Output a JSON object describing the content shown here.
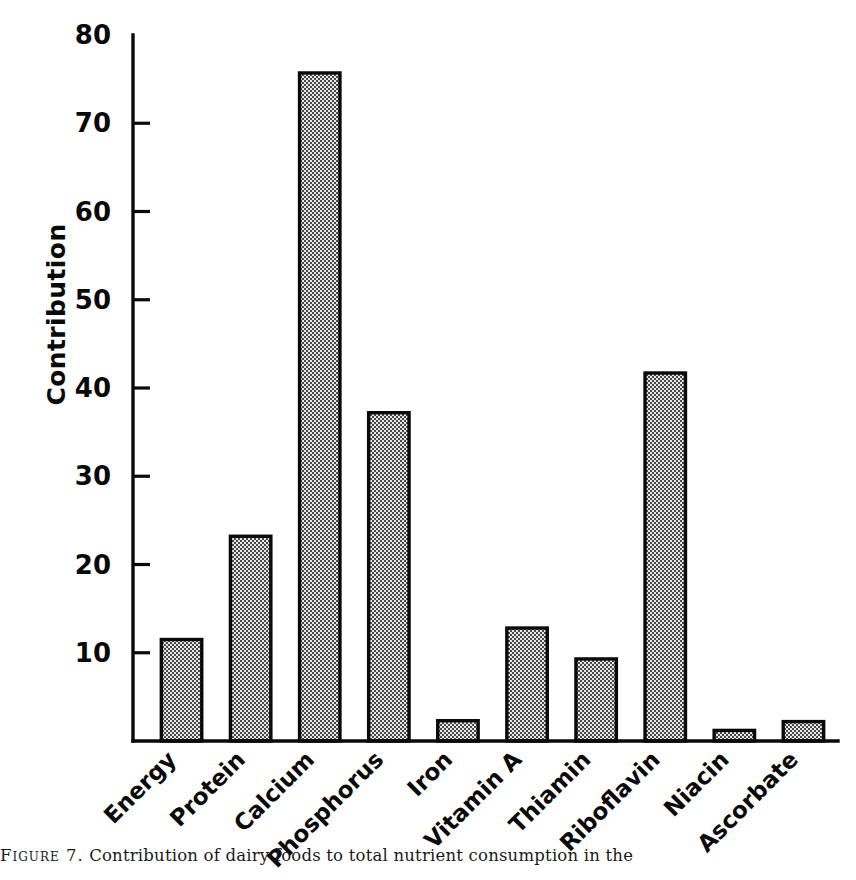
{
  "chart_data": {
    "type": "bar",
    "title": "",
    "xlabel": "",
    "ylabel": "Contribution",
    "ylim": [
      0,
      80
    ],
    "yticks": [
      10,
      20,
      30,
      40,
      50,
      60,
      70,
      80
    ],
    "ytick_labels": [
      "10",
      "20",
      "30",
      "40",
      "50",
      "60",
      "70",
      "80"
    ],
    "grid": false,
    "legend": false,
    "categories": [
      "Energy",
      "Protein",
      "Calcium",
      "Phosphorus",
      "Iron",
      "Vitamin A",
      "Thiamin",
      "Riboflavin",
      "Niacin",
      "Ascorbate"
    ],
    "values": [
      11.5,
      23.2,
      75.7,
      37.2,
      2.3,
      12.8,
      9.3,
      41.7,
      1.2,
      2.2
    ],
    "bar_fill": "#b9b9b9",
    "bar_edge": "#0a0a0a",
    "axis_color": "#0a0a0a",
    "background": "#ffffff",
    "xtick_rotation": 45
  },
  "caption": {
    "label": "Figure 7.",
    "text": "Contribution of dairy foods to total nutrient consumption in the"
  }
}
